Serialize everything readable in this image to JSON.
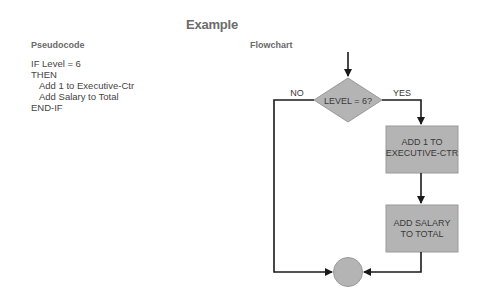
{
  "title": "Example",
  "pseudocode": {
    "label": "Pseudocode",
    "lines": [
      {
        "text": "IF Level = 6",
        "indent": false
      },
      {
        "text": "THEN",
        "indent": false
      },
      {
        "text": "Add 1 to Executive-Ctr",
        "indent": true
      },
      {
        "text": "Add Salary to Total",
        "indent": true
      },
      {
        "text": "END-IF",
        "indent": false
      }
    ]
  },
  "flowchart": {
    "label": "Flowchart",
    "decision": "LEVEL = 6?",
    "no_label": "NO",
    "yes_label": "YES",
    "process1": [
      "ADD 1 TO",
      "EXECUTIVE-CTR"
    ],
    "process2": [
      "ADD SALARY",
      "TO TOTAL"
    ],
    "colors": {
      "shape_fill": "#b4b4b4",
      "shape_stroke": "#9a9a9a",
      "line": "#1a1a1a"
    }
  }
}
